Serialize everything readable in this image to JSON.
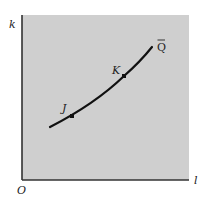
{
  "diagram": {
    "type": "isoquant",
    "axes": {
      "y_label": "k",
      "x_label": "l",
      "origin_label": "O"
    },
    "curve": {
      "label": "Q",
      "label_decoration": "overbar"
    },
    "points": [
      {
        "id": "J",
        "label": "J"
      },
      {
        "id": "K",
        "label": "K"
      }
    ],
    "colors": {
      "panel_background": "#cfcfcf",
      "axis": "#333333",
      "curve": "#111111",
      "page_background": "#ffffff"
    }
  }
}
